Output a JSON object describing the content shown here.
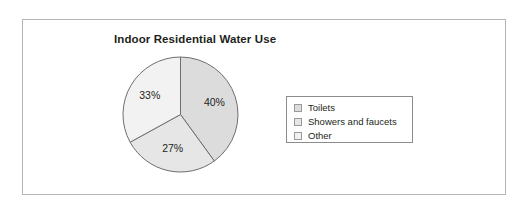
{
  "figure": {
    "title": "Indoor Residential Water Use",
    "frame_color": "#b4b4b4",
    "background": "#ffffff"
  },
  "legend": {
    "position": "right",
    "border_color": "#8c8c8c",
    "items": [
      {
        "label": "Toilets",
        "color": "#dcdcdc",
        "swatch_icon": "square-swatch-icon"
      },
      {
        "label": "Showers and faucets",
        "color": "#e6e6e6",
        "swatch_icon": "square-swatch-icon"
      },
      {
        "label": "Other",
        "color": "#f2f2f2",
        "swatch_icon": "square-swatch-icon"
      }
    ]
  },
  "labels": {
    "toilets_pct": "40%",
    "showers_pct": "27%",
    "other_pct": "33%"
  },
  "chart_data": {
    "type": "pie",
    "title": "Indoor Residential Water Use",
    "xlabel": "",
    "ylabel": "",
    "start_angle_deg": 90,
    "direction": "clockwise",
    "categories": [
      "Toilets",
      "Showers and faucets",
      "Other"
    ],
    "values": [
      40,
      27,
      33
    ],
    "value_labels": [
      "40%",
      "27%",
      "33%"
    ],
    "units": "percent",
    "colors": [
      "#dcdcdc",
      "#e6e6e6",
      "#f2f2f2"
    ],
    "slice_outline_color": "#6e6e6e",
    "legend_entries": [
      "Toilets",
      "Showers and faucets",
      "Other"
    ],
    "legend_position": "right",
    "grid": false,
    "annotations": []
  }
}
